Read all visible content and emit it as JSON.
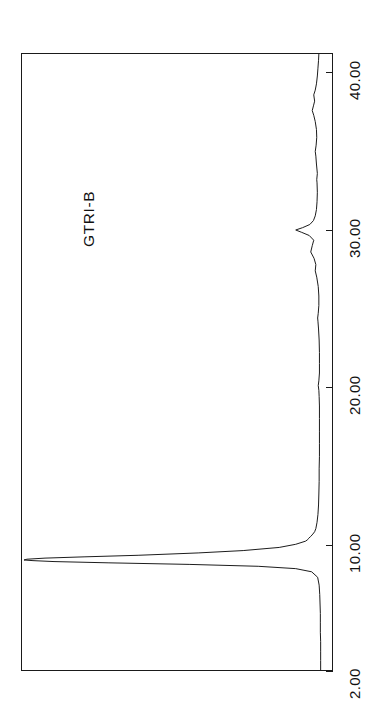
{
  "figure": {
    "kind": "chromatogram",
    "background_color": "#ffffff",
    "line_color": "#1a1a1a",
    "frame_color": "#1a1a1a",
    "orientation": "rotated-90-ccw",
    "sample_label": "GTRI-B"
  },
  "chart_data": {
    "type": "line",
    "title": "GTRI-B",
    "xlabel": "",
    "ylabel": "",
    "orientation": "rotated-90-ccw",
    "grid": false,
    "legend": false,
    "axis": {
      "name": "retention-time",
      "unit": "min",
      "xlim": [
        2.0,
        41.2
      ],
      "tick_labels": [
        "2.00",
        "10.00",
        "20.00",
        "30.00",
        "40.00"
      ],
      "tick_values": [
        2.0,
        10.0,
        20.0,
        30.0,
        40.0
      ],
      "direction": "bottom-to-top"
    },
    "signal_axis": {
      "name": "detector-response",
      "ylim": [
        0,
        1
      ],
      "tick_labels": [],
      "direction": "right-to-left",
      "baseline_fraction": 0.975
    },
    "annotations": [
      {
        "label": "GTRI-B",
        "position": "upper-left"
      }
    ],
    "peaks": [
      {
        "retention_time": 9.05,
        "relative_height": 1.0,
        "note": "main peak, off-scale / saturated, broad tail"
      },
      {
        "retention_time": 10.35,
        "relative_height": 0.055,
        "note": "small shoulder after main peak"
      },
      {
        "retention_time": 20.1,
        "relative_height": 0.02
      },
      {
        "retention_time": 24.4,
        "relative_height": 0.022
      },
      {
        "retention_time": 27.4,
        "relative_height": 0.03
      },
      {
        "retention_time": 28.6,
        "relative_height": 0.045
      },
      {
        "retention_time": 30.0,
        "relative_height": 0.095,
        "note": "second largest peak"
      },
      {
        "retention_time": 33.2,
        "relative_height": 0.025
      },
      {
        "retention_time": 35.0,
        "relative_height": 0.03
      },
      {
        "retention_time": 37.6,
        "relative_height": 0.04
      },
      {
        "retention_time": 38.6,
        "relative_height": 0.035
      }
    ],
    "series": [
      {
        "name": "detector signal",
        "x": [
          2.0,
          2.6,
          3.2,
          3.8,
          4.4,
          5.0,
          5.6,
          6.2,
          6.8,
          7.4,
          7.9,
          8.25,
          8.45,
          8.6,
          8.72,
          8.82,
          8.9,
          8.96,
          9.0,
          9.05,
          9.12,
          9.2,
          9.3,
          9.45,
          9.6,
          9.8,
          10.0,
          10.2,
          10.3,
          10.38,
          10.5,
          10.65,
          10.8,
          11.0,
          11.4,
          11.9,
          12.5,
          13.2,
          14.0,
          14.8,
          15.6,
          16.4,
          17.2,
          18.0,
          18.8,
          19.4,
          19.8,
          20.1,
          20.4,
          20.9,
          21.5,
          22.2,
          23.0,
          23.7,
          24.2,
          24.4,
          24.7,
          25.2,
          25.8,
          26.4,
          27.0,
          27.4,
          27.8,
          28.2,
          28.6,
          29.0,
          29.35,
          29.65,
          29.85,
          30.0,
          30.15,
          30.35,
          30.6,
          30.9,
          31.3,
          31.8,
          32.4,
          33.0,
          33.2,
          33.6,
          34.2,
          34.7,
          35.0,
          35.4,
          35.9,
          36.4,
          36.9,
          37.3,
          37.6,
          37.9,
          38.2,
          38.6,
          38.9,
          39.3,
          39.8,
          40.3,
          40.8,
          41.2
        ],
        "y": [
          0.012,
          0.012,
          0.012,
          0.012,
          0.013,
          0.013,
          0.013,
          0.014,
          0.015,
          0.017,
          0.022,
          0.042,
          0.095,
          0.22,
          0.45,
          0.72,
          0.9,
          0.97,
          1.0,
          0.99,
          0.93,
          0.8,
          0.62,
          0.42,
          0.27,
          0.15,
          0.095,
          0.062,
          0.055,
          0.052,
          0.045,
          0.038,
          0.032,
          0.028,
          0.024,
          0.021,
          0.019,
          0.018,
          0.017,
          0.017,
          0.016,
          0.016,
          0.016,
          0.016,
          0.016,
          0.017,
          0.018,
          0.02,
          0.018,
          0.016,
          0.016,
          0.016,
          0.017,
          0.019,
          0.021,
          0.022,
          0.02,
          0.018,
          0.018,
          0.02,
          0.025,
          0.03,
          0.028,
          0.034,
          0.045,
          0.04,
          0.035,
          0.05,
          0.075,
          0.095,
          0.072,
          0.048,
          0.036,
          0.03,
          0.026,
          0.024,
          0.023,
          0.024,
          0.025,
          0.023,
          0.026,
          0.028,
          0.03,
          0.027,
          0.025,
          0.026,
          0.03,
          0.035,
          0.04,
          0.036,
          0.032,
          0.035,
          0.03,
          0.026,
          0.023,
          0.021,
          0.019,
          0.018
        ]
      }
    ]
  },
  "ticks": [
    {
      "label": "2.00",
      "value": 2.0
    },
    {
      "label": "10.00",
      "value": 10.0
    },
    {
      "label": "20.00",
      "value": 20.0
    },
    {
      "label": "30.00",
      "value": 30.0
    },
    {
      "label": "40.00",
      "value": 40.0
    }
  ]
}
